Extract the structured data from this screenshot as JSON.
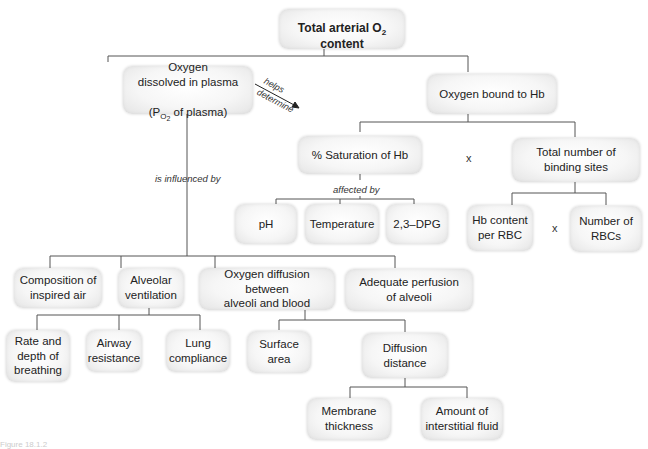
{
  "diagram": {
    "root": {
      "text_before_sub": "Total arterial O",
      "sub": "2",
      "text_after_sub": " content"
    },
    "nodes": {
      "dissolved": {
        "line1": "Oxygen",
        "line2": "dissolved in plasma",
        "line3_before": "(P",
        "line3_sub": "O",
        "line3_sub2": "2",
        "line3_after": " of plasma)"
      },
      "bound": "Oxygen bound to Hb",
      "saturation": "% Saturation of Hb",
      "binding_sites": "Total number of\nbinding sites",
      "ph": "pH",
      "temperature": "Temperature",
      "dpg": "2,3–DPG",
      "hb_content": "Hb content\nper RBC",
      "num_rbcs": "Number of\nRBCs",
      "composition": "Composition of\ninspired air",
      "alveolar_ventilation": "Alveolar\nventilation",
      "oxygen_diffusion": "Oxygen diffusion between\nalveoli and blood",
      "perfusion": "Adequate perfusion\nof alveoli",
      "rate_depth": "Rate and\ndepth of\nbreathing",
      "airway_resistance": "Airway\nresistance",
      "lung_compliance": "Lung\ncompliance",
      "surface_area": "Surface\narea",
      "diffusion_distance": "Diffusion\ndistance",
      "membrane_thickness": "Membrane\nthickness",
      "interstitial_fluid": "Amount of\ninterstitial fluid"
    },
    "edge_labels": {
      "helps": "helps",
      "determine": "determine",
      "influenced_by": "is influenced by",
      "affected_by": "affected by"
    },
    "operators": {
      "sat_times_sites": "x",
      "hb_times_rbcs": "x"
    },
    "caption": "Figure 18.1.2"
  }
}
